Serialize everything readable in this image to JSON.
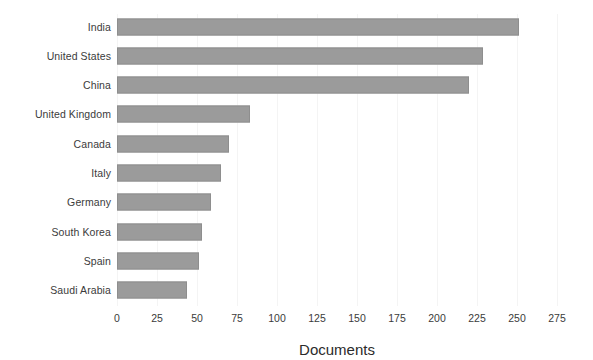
{
  "chart_data": {
    "type": "bar",
    "orientation": "horizontal",
    "title": "",
    "xlabel": "Documents",
    "ylabel": "",
    "categories": [
      "India",
      "United States",
      "China",
      "United Kingdom",
      "Canada",
      "Italy",
      "Germany",
      "South Korea",
      "Spain",
      "Saudi Arabia"
    ],
    "values": [
      251,
      229,
      220,
      83,
      70,
      65,
      59,
      53,
      51,
      44
    ],
    "xlim": [
      0,
      275
    ],
    "xticks": [
      "0",
      "25",
      "50",
      "75",
      "100",
      "125",
      "150",
      "175",
      "200",
      "225",
      "250",
      "275"
    ],
    "xtick_values": [
      0,
      25,
      50,
      75,
      100,
      125,
      150,
      175,
      200,
      225,
      250,
      275
    ],
    "grid": "vertical-faint",
    "legend": "none",
    "bar_color": "#9b9b9b",
    "bar_edge_color": "#8e8e8e",
    "text_color": "#3b3b3b"
  }
}
